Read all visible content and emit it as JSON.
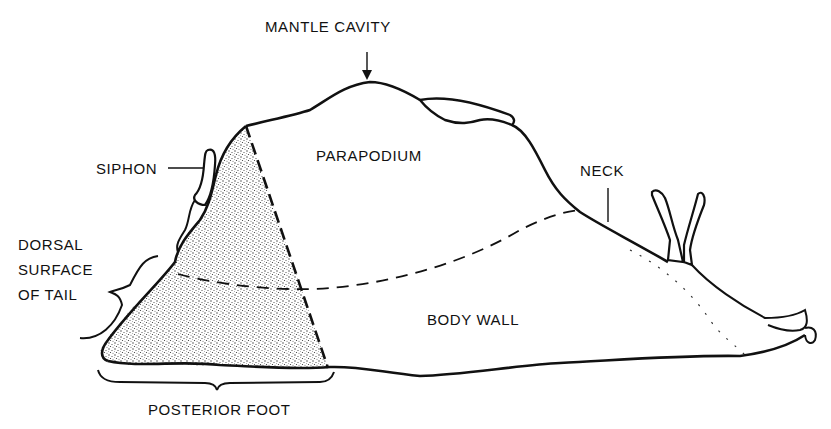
{
  "figure": {
    "style": "black ink line drawing with stippled region",
    "colors": {
      "ink": "#111111",
      "background": "#ffffff",
      "stipple": "#9a9a9a"
    }
  },
  "labels": {
    "mantle_cavity": "MANTLE CAVITY",
    "parapodium": "PARAPODIUM",
    "siphon": "SIPHON",
    "neck": "NECK",
    "dorsal_surface_of_tail": [
      "DORSAL",
      "SURFACE",
      "OF TAIL"
    ],
    "body_wall": "BODY WALL",
    "posterior_foot": "POSTERIOR FOOT"
  }
}
